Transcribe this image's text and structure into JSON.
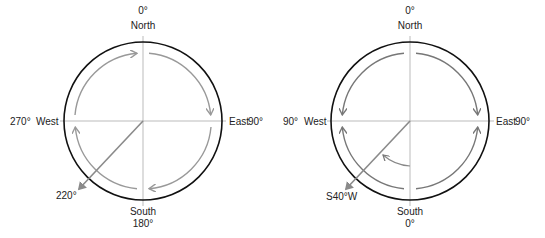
{
  "diagrams": [
    {
      "id": "azimuth",
      "labels": {
        "north_deg": "0°",
        "north": "North",
        "east": "East",
        "east_deg": "90°",
        "south": "South",
        "south_deg": "180°",
        "west_deg": "270°",
        "west": "West",
        "bearing": "220°"
      }
    },
    {
      "id": "quadrant-bearing",
      "labels": {
        "north_deg": "0°",
        "north": "North",
        "east": "East",
        "east_deg": "90°",
        "south": "South",
        "south_deg": "0°",
        "west_deg": "90°",
        "west": "West",
        "bearing": "S40°W"
      }
    }
  ],
  "colors": {
    "circle": "#111111",
    "axis": "#aaaaaa",
    "arrow_left": "#999999",
    "arrow_right": "#777777",
    "bearing_line": "#8a8a8a"
  }
}
